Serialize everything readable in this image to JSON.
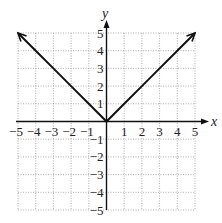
{
  "chart_data": {
    "type": "line",
    "title": "",
    "xlabel": "x",
    "ylabel": "y",
    "xlim": [
      -5,
      5
    ],
    "ylim": [
      -5,
      5
    ],
    "grid": true,
    "x_ticks": [
      "-5",
      "-4",
      "-3",
      "-2",
      "-1",
      "1",
      "2",
      "3",
      "4",
      "5"
    ],
    "y_ticks": [
      "5",
      "4",
      "3",
      "2",
      "1",
      "-1",
      "-2",
      "-3",
      "-4",
      "-5"
    ],
    "series": [
      {
        "name": "y = |x|",
        "x": [
          -5,
          -4,
          -3,
          -2,
          -1,
          0,
          1,
          2,
          3,
          4,
          5
        ],
        "values": [
          5,
          4,
          3,
          2,
          1,
          0,
          1,
          2,
          3,
          4,
          5
        ],
        "arrows_at_ends": true
      }
    ]
  },
  "labels": {
    "x_axis": "x",
    "y_axis": "y"
  }
}
